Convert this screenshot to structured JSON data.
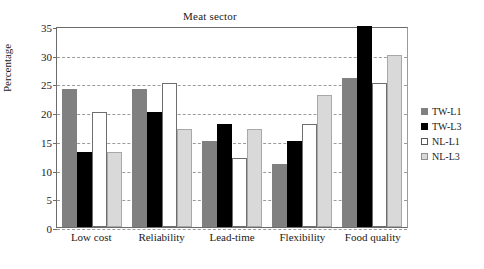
{
  "chart_data": {
    "type": "bar",
    "title": "Meat sector",
    "xlabel": "",
    "ylabel": "Percentage",
    "categories": [
      "Low cost",
      "Reliability",
      "Lead-time",
      "Flexibility",
      "Food quality"
    ],
    "series": [
      {
        "name": "TW-L1",
        "color": "#808080",
        "values": [
          24,
          24,
          15,
          11,
          26
        ]
      },
      {
        "name": "TW-L3",
        "color": "#000000",
        "values": [
          13,
          20,
          18,
          15,
          35
        ]
      },
      {
        "name": "NL-L1",
        "color": "#ffffff",
        "values": [
          20,
          25,
          12,
          18,
          25
        ]
      },
      {
        "name": "NL-L3",
        "color": "#d9d9d9",
        "values": [
          13,
          17,
          17,
          23,
          30
        ]
      }
    ],
    "ylim": [
      0,
      35
    ],
    "yticks": [
      0,
      5,
      10,
      15,
      20,
      25,
      30,
      35
    ],
    "grid": true,
    "legend_position": "right"
  }
}
